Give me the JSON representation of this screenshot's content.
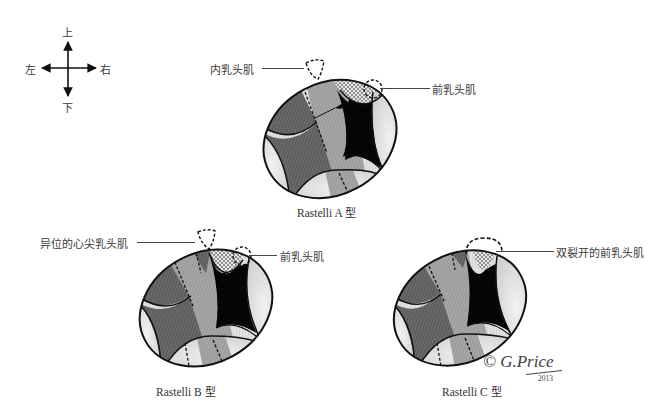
{
  "compass": {
    "up": "上",
    "down": "下",
    "left": "左",
    "right": "右"
  },
  "diagrams": [
    {
      "id": "A",
      "caption_prefix": "Rastelli A",
      "caption_suffix": "型",
      "callouts": [
        {
          "text": "内乳头肌",
          "side": "left"
        },
        {
          "text": "前乳头肌",
          "side": "right"
        }
      ]
    },
    {
      "id": "B",
      "caption_prefix": "Rastelli B",
      "caption_suffix": "型",
      "callouts": [
        {
          "text": "异位的心尖乳头肌",
          "side": "left"
        },
        {
          "text": "前乳头肌",
          "side": "right"
        }
      ]
    },
    {
      "id": "C",
      "caption_prefix": "Rastelli C",
      "caption_suffix": "型",
      "callouts": [
        {
          "text": "双裂开的前乳头肌",
          "side": "right"
        }
      ]
    }
  ],
  "signature": {
    "text": "© G.Price",
    "year": "2013"
  },
  "colors": {
    "outline": "#111111",
    "black_region": "#050505",
    "dark_gray": "#6e6e6e",
    "mid_gray": "#a3a3a3",
    "light_gray": "#e4e4e4",
    "checker_a": "#9a9a9a",
    "checker_b": "#e8e8e8"
  }
}
